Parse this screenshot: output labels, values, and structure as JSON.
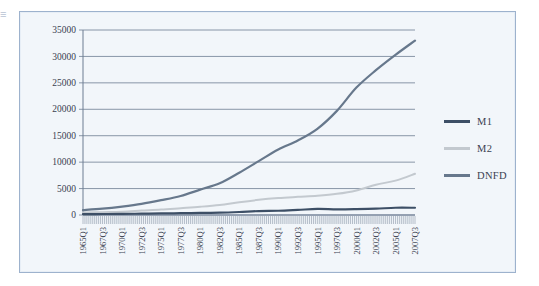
{
  "figure": {
    "edge_glyph": "≡",
    "frame_color": "#9db2cd",
    "plot_background": "#f2f6fa"
  },
  "legend": {
    "position": "right",
    "entries": [
      {
        "label": "M1",
        "color": "#3d4f66"
      },
      {
        "label": "M2",
        "color": "#c3c9cf"
      },
      {
        "label": "DNFD",
        "color": "#67788c"
      }
    ]
  },
  "chart_data": {
    "type": "line",
    "title": "",
    "xlabel": "",
    "ylabel": "",
    "ylim": [
      0,
      35000
    ],
    "ytick_labels": [
      "0",
      "5000",
      "10000",
      "15000",
      "20000",
      "25000",
      "30000",
      "35000"
    ],
    "ytick_values": [
      0,
      5000,
      10000,
      15000,
      20000,
      25000,
      30000,
      35000
    ],
    "grid": true,
    "grid_axis": "y",
    "x_tick_labels": [
      "1965Q1",
      "1967Q3",
      "1970Q1",
      "1972Q3",
      "1975Q1",
      "1977Q3",
      "1980Q1",
      "1982Q3",
      "1985Q1",
      "1987Q3",
      "1990Q1",
      "1992Q3",
      "1995Q1",
      "1997Q3",
      "2000Q1",
      "2002Q3",
      "2005Q1",
      "2007Q3"
    ],
    "x_tick_label_rotation": -90,
    "x_minor_ticks": "quarterly",
    "x": [
      "1965Q1",
      "1967Q3",
      "1970Q1",
      "1972Q3",
      "1975Q1",
      "1977Q3",
      "1980Q1",
      "1982Q3",
      "1985Q1",
      "1987Q3",
      "1990Q1",
      "1992Q3",
      "1995Q1",
      "1997Q3",
      "2000Q1",
      "2002Q3",
      "2005Q1",
      "2007Q3"
    ],
    "series": [
      {
        "name": "M1",
        "color": "#3d4f66",
        "values": [
          160,
          185,
          215,
          255,
          290,
          340,
          390,
          440,
          570,
          750,
          800,
          960,
          1150,
          1075,
          1115,
          1200,
          1375,
          1370
        ]
      },
      {
        "name": "M2",
        "color": "#c3c9cf",
        "values": [
          450,
          540,
          630,
          830,
          1020,
          1290,
          1560,
          1900,
          2420,
          2870,
          3200,
          3430,
          3640,
          4000,
          4650,
          5740,
          6500,
          7800
        ]
      },
      {
        "name": "DNFD",
        "color": "#67788c",
        "values": [
          930,
          1200,
          1600,
          2100,
          2800,
          3600,
          4800,
          6000,
          8000,
          10200,
          12400,
          14100,
          16300,
          19700,
          24100,
          27400,
          30300,
          33000
        ]
      }
    ]
  }
}
